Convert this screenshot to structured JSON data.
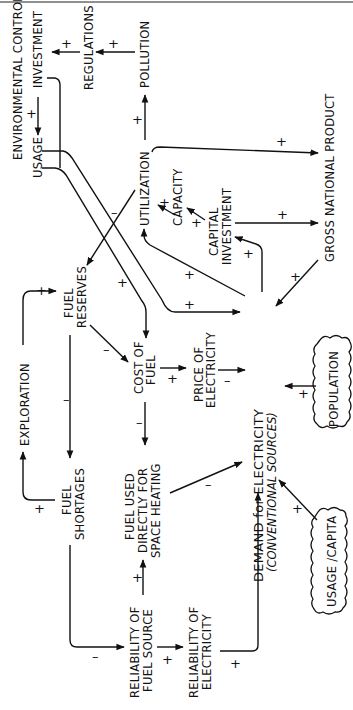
{
  "diagram": {
    "type": "causal-loop-diagram",
    "orientation": "rotated-90-ccw",
    "nodes": {
      "environmental_control": "ENVIRONMENTAL CONTROL",
      "investment": "INVESTMENT",
      "usage": "USAGE",
      "regulations": "REGULATIONS",
      "pollution": "POLLUTION",
      "utilization": "UTILIZATION",
      "capacity": "CAPACITY",
      "capital_investment_1": "CAPITAL",
      "capital_investment_2": "INVESTMENT",
      "gnp": "GROSS NATIONAL PRODUCT",
      "fuel_reserves_1": "FUEL",
      "fuel_reserves_2": "RESERVES",
      "exploration": "EXPLORATION",
      "cost_of_fuel_1": "COST OF",
      "cost_of_fuel_2": "FUEL",
      "price_of_electricity_1": "PRICE OF",
      "price_of_electricity_2": "ELECTRICITY",
      "demand_1": "DEMAND  for  ELECTRICITY",
      "demand_2": "(CONVENTIONAL  SOURCES)",
      "population": "POPULATION",
      "fuel_shortages_1": "FUEL",
      "fuel_shortages_2": "SHORTAGES",
      "fuel_used_1": "FUEL  USED",
      "fuel_used_2": "DIRECTLY  FOR",
      "fuel_used_3": "SPACE HEATING",
      "usage_per_capita": "USAGE /CAPITA",
      "reliability_fuel_1": "RELIABILITY OF",
      "reliability_fuel_2": "FUEL  SOURCE",
      "reliability_elec_1": "RELIABILITY OF",
      "reliability_elec_2": "ELECTRICITY"
    },
    "edges": [
      {
        "from": "Environmental Control Investment",
        "to": "Usage",
        "sign": "+"
      },
      {
        "from": "Regulations",
        "to": "Environmental Control Investment",
        "sign": "+"
      },
      {
        "from": "Pollution",
        "to": "Regulations",
        "sign": "+"
      },
      {
        "from": "Utilization",
        "to": "Pollution",
        "sign": "+"
      },
      {
        "from": "Utilization",
        "to": "Gross National Product",
        "sign": "+"
      },
      {
        "from": "Utilization",
        "to": "Fuel Reserves",
        "sign": "-"
      },
      {
        "from": "Capacity",
        "to": "Utilization",
        "sign": "+"
      },
      {
        "from": "Capital Investment",
        "to": "Capacity",
        "sign": "+"
      },
      {
        "from": "Capital Investment",
        "to": "Gross National Product",
        "sign": "+"
      },
      {
        "from": "Gross National Product",
        "to": "Demand for Electricity",
        "sign": "+"
      },
      {
        "from": "Demand for Electricity",
        "to": "Capital Investment",
        "sign": "+"
      },
      {
        "from": "Demand for Electricity",
        "to": "Utilization",
        "sign": "+"
      },
      {
        "from": "Usage",
        "to": "Demand for Electricity",
        "sign": "+"
      },
      {
        "from": "Usage",
        "to": "Cost of Fuel",
        "sign": "+"
      },
      {
        "from": "Fuel Reserves",
        "to": "Cost of Fuel",
        "sign": "-"
      },
      {
        "from": "Fuel Reserves",
        "to": "Fuel Shortages",
        "sign": "-"
      },
      {
        "from": "Exploration",
        "to": "Fuel Reserves",
        "sign": "+"
      },
      {
        "from": "Fuel Shortages",
        "to": "Exploration",
        "sign": "+"
      },
      {
        "from": "Fuel Shortages",
        "to": "Reliability of Fuel Source",
        "sign": "-"
      },
      {
        "from": "Cost of Fuel",
        "to": "Price of Electricity",
        "sign": "+"
      },
      {
        "from": "Cost of Fuel",
        "to": "Fuel Used Directly for Space Heating",
        "sign": "-"
      },
      {
        "from": "Price of Electricity",
        "to": "Demand for Electricity",
        "sign": "-"
      },
      {
        "from": "Population",
        "to": "Demand for Electricity",
        "sign": "+"
      },
      {
        "from": "Fuel Used Directly for Space Heating",
        "to": "Demand for Electricity",
        "sign": "-"
      },
      {
        "from": "Reliability of Fuel Source",
        "to": "Fuel Used Directly for Space Heating",
        "sign": "+"
      },
      {
        "from": "Reliability of Fuel Source",
        "to": "Reliability of Electricity",
        "sign": "+"
      },
      {
        "from": "Reliability of Electricity",
        "to": "Demand for Electricity",
        "sign": "+"
      },
      {
        "from": "Usage/Capita",
        "to": "Demand for Electricity",
        "sign": "+"
      }
    ],
    "signs": {
      "plus": "+",
      "minus": "–"
    }
  }
}
